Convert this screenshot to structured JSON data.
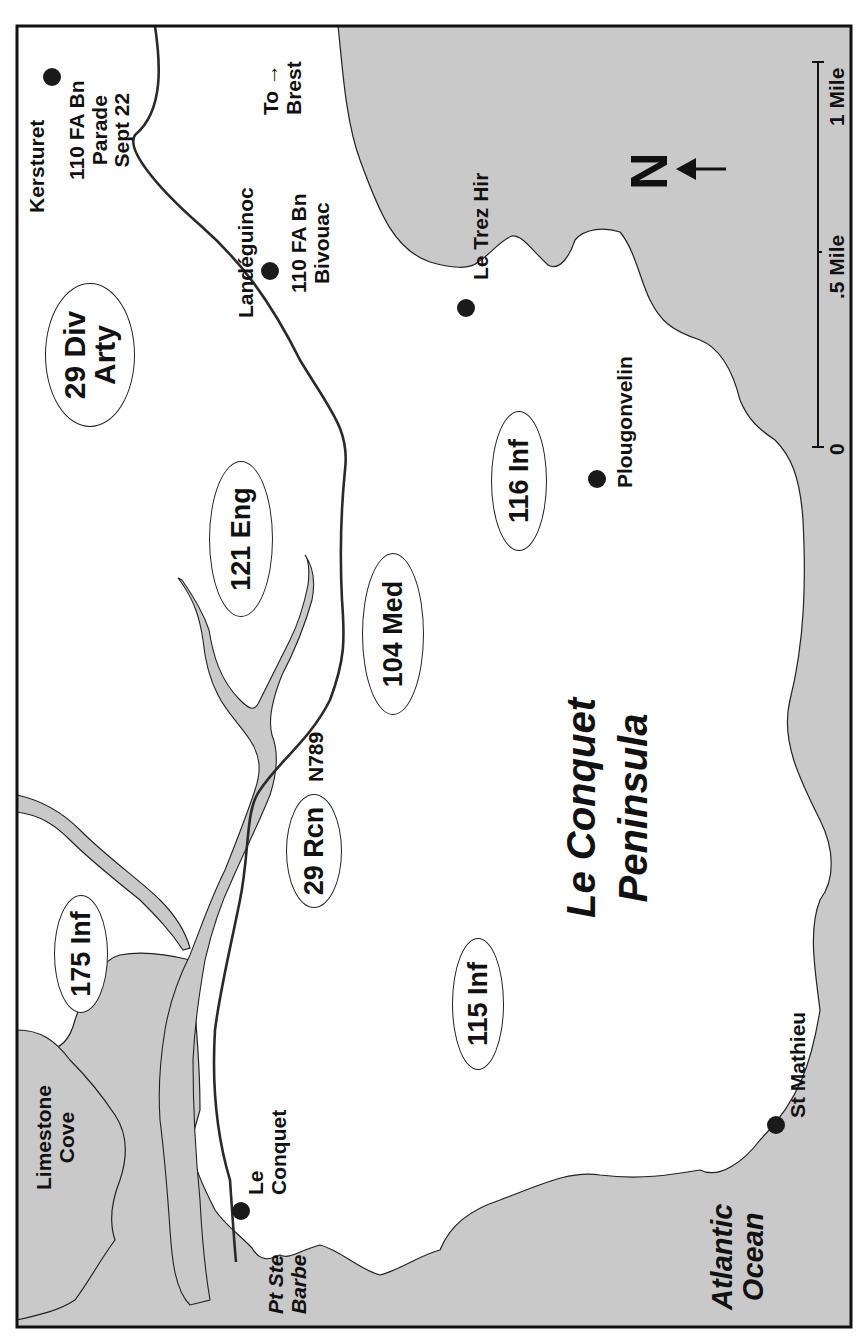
{
  "map": {
    "title": "Le Conquet Peninsula",
    "colors": {
      "water": "#c9c9c9",
      "land": "#ffffff",
      "outline": "#222222",
      "road": "#2a2a2a"
    },
    "region_label": {
      "line1": "Le Conquet",
      "line2": "Peninsula"
    },
    "water_labels": {
      "atlantic": {
        "line1": "Atlantic",
        "line2": "Ocean"
      },
      "limestone_cove": {
        "line1": "Limestone",
        "line2": "Cove"
      },
      "pt_ste_barbe": {
        "line1": "Pt Ste",
        "line2": "Barbe"
      }
    },
    "places": [
      {
        "id": "kersturet",
        "name": "Kersturet"
      },
      {
        "id": "landeguinoc",
        "name": "Landéguinoc"
      },
      {
        "id": "le_trez_hir",
        "name": "Le Trez Hir"
      },
      {
        "id": "plougonvelin",
        "name": "Plougonvelin"
      },
      {
        "id": "st_mathieu",
        "name": "St Mathieu"
      },
      {
        "id": "le_conquet",
        "name": "Le Conquet",
        "line1": "Le",
        "line2": "Conquet"
      }
    ],
    "annotations": {
      "parade": {
        "line1": "110 FA Bn",
        "line2": "Parade",
        "line3": "Sept 22"
      },
      "bivouac": {
        "line1": "110 FA Bn",
        "line2": "Bivouac"
      },
      "to_brest": {
        "line1": "To →",
        "line2": "Brest"
      },
      "road": "N789"
    },
    "units": [
      {
        "id": "29-div-arty",
        "line1": "29 Div",
        "line2": "Arty"
      },
      {
        "id": "121-eng",
        "label": "121 Eng"
      },
      {
        "id": "104-med",
        "label": "104 Med"
      },
      {
        "id": "116-inf",
        "label": "116 Inf"
      },
      {
        "id": "29-rcn",
        "label": "29 Rcn"
      },
      {
        "id": "175-inf",
        "label": "175 Inf"
      },
      {
        "id": "115-inf",
        "label": "115 Inf"
      }
    ],
    "compass": {
      "label": "N",
      "arrow": "←"
    },
    "scale_bar": {
      "ticks": [
        "0",
        ".5 Mile",
        "1 Mile"
      ]
    }
  }
}
